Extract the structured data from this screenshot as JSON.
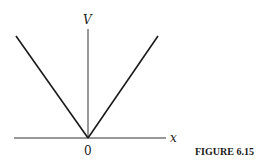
{
  "figure": {
    "caption": "FIGURE 6.15",
    "y_axis_label": "V",
    "x_axis_label": "x",
    "origin_label": "0"
  },
  "graph": {
    "description": "V-shaped graph V = |x| with vertex at origin",
    "line_color": "#1a1a1a",
    "axis_color": "#333333"
  }
}
